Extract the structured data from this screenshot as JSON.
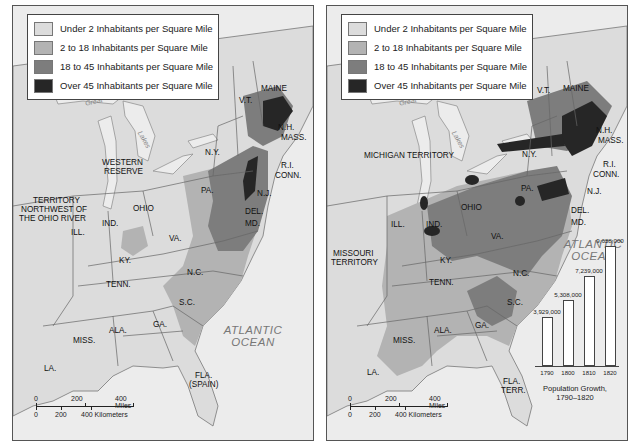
{
  "colors": {
    "water": "#ececec",
    "under_2": "#dcdcdc",
    "from_2_to_18": "#b3b3b3",
    "from_18_to_45": "#7d7d7d",
    "over_45": "#262626",
    "border": "#666666"
  },
  "legend": [
    {
      "label": "Under 2 Inhabitants per Square Mile",
      "color": "#dcdcdc"
    },
    {
      "label": "2 to 18 Inhabitants per Square Mile",
      "color": "#b3b3b3"
    },
    {
      "label": "18 to 45 Inhabitants per Square Mile",
      "color": "#7d7d7d"
    },
    {
      "label": "Over 45 Inhabitants per Square Mile",
      "color": "#262626"
    }
  ],
  "maps": [
    {
      "labels": {
        "maine": "MAINE",
        "vt": "V.T.",
        "nh": "N.H.",
        "mass": "MASS.",
        "ny": "N.Y.",
        "ri": "R.I.",
        "conn": "CONN.",
        "nj": "N.J.",
        "pa": "PA.",
        "del": "DEL.",
        "md": "MD.",
        "western_reserve_1": "WESTERN",
        "western_reserve_2": "RESERVE",
        "territory_1": "TERRITORY",
        "territory_2": "NORTHWEST OF",
        "territory_3": "THE OHIO RIVER",
        "ill": "ILL.",
        "ind": "IND.",
        "ohio": "OHIO",
        "va": "VA.",
        "ky": "KY.",
        "tenn": "TENN.",
        "nc": "N.C.",
        "sc": "S.C.",
        "ga": "GA.",
        "ala": "ALA.",
        "miss": "MISS.",
        "la": "LA.",
        "fla_1": "FLA.",
        "fla_2": "(SPAIN)",
        "ocean_1": "ATLANTIC",
        "ocean_2": "OCEAN",
        "lake_1": "Great",
        "lake_2": "Lakes"
      },
      "scale": {
        "miles": [
          "0",
          "200",
          "400 Miles"
        ],
        "km": [
          "0",
          "200",
          "400 Kilometers"
        ]
      }
    },
    {
      "labels": {
        "maine": "MAINE",
        "vt": "V.T.",
        "nh": "N.H.",
        "mass": "MASS.",
        "ny": "N.Y.",
        "ri": "R.I.",
        "conn": "CONN.",
        "nj": "N.J.",
        "pa": "PA.",
        "del": "DEL.",
        "md": "MD.",
        "michigan": "MICHIGAN TERRITORY",
        "missouri_1": "MISSOURI",
        "missouri_2": "TERRITORY",
        "ill": "ILL.",
        "ind": "IND.",
        "ohio": "OHIO",
        "va": "VA.",
        "ky": "KY.",
        "tenn": "TENN.",
        "nc": "N.C.",
        "sc": "S.C.",
        "ga": "GA.",
        "ala": "ALA.",
        "miss": "MISS.",
        "la": "LA.",
        "fla_1": "FLA.",
        "fla_2": "TERR.",
        "ocean_1": "ATLANTIC",
        "ocean_2": "OCEAN",
        "lake_1": "Great",
        "lake_2": "Lakes"
      },
      "scale": {
        "miles": [
          "0",
          "200",
          "400 Miles"
        ],
        "km": [
          "0",
          "200",
          "400 Kilometers"
        ]
      }
    }
  ],
  "chart_data": {
    "type": "bar",
    "title": "Population Growth, 1790–1820",
    "caption_line_1": "Population Growth,",
    "caption_line_2": "1790–1820",
    "categories": [
      "1790",
      "1800",
      "1810",
      "1820"
    ],
    "values": [
      3929000,
      5308000,
      7239000,
      9638000
    ],
    "value_labels": [
      "3,929,000",
      "5,308,000",
      "7,239,000",
      "9,638,000"
    ],
    "xlabel": "",
    "ylabel": "",
    "ylim": [
      0,
      10000000
    ],
    "grid": false
  }
}
